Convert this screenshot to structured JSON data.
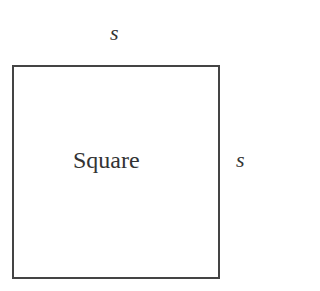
{
  "diagram": {
    "shape": "square",
    "top_side_label": "s",
    "right_side_label": "s",
    "center_label": "Square",
    "stroke_color": "#444444",
    "background": "#ffffff"
  }
}
